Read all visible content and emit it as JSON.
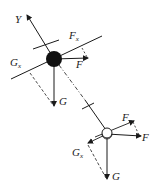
{
  "diagram": {
    "type": "force-decomposition",
    "colors": {
      "ink": "#1a1a1a",
      "background": "#ffffff"
    },
    "axis": {
      "label": "Y"
    },
    "upper_body": {
      "shape": "solid-circle",
      "forces": {
        "F": {
          "label": "F"
        },
        "Fx": {
          "main": "F",
          "sub": "x"
        },
        "Gx": {
          "main": "G",
          "sub": "x"
        },
        "G": {
          "label": "G"
        }
      }
    },
    "lower_body": {
      "shape": "hollow-circle",
      "forces": {
        "F": {
          "label": "F"
        },
        "Fx": {
          "main": "F",
          "sub": "x"
        },
        "Gx": {
          "main": "G",
          "sub": "x"
        },
        "G": {
          "label": "G"
        }
      }
    }
  }
}
